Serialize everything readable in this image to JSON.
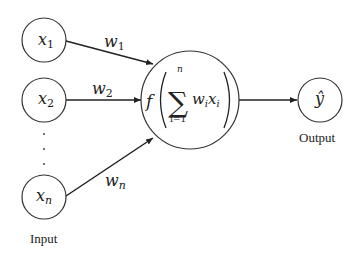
{
  "diagram": {
    "type": "perceptron",
    "inputs": [
      {
        "id": "x1",
        "var": "x",
        "sub": "1",
        "weight_var": "w",
        "weight_sub": "1"
      },
      {
        "id": "x2",
        "var": "x",
        "sub": "2",
        "weight_var": "w",
        "weight_sub": "2"
      },
      {
        "id": "xn",
        "var": "x",
        "sub": "n",
        "weight_var": "w",
        "weight_sub": "n"
      }
    ],
    "ellipsis": "⋮",
    "neuron": {
      "func": "f",
      "sum_symbol": "∑",
      "sum_upper": "n",
      "sum_lower": "i=1",
      "term_w": "w",
      "term_w_sub": "i",
      "term_x": "x",
      "term_x_sub": "i"
    },
    "output": {
      "symbol": "ŷ"
    },
    "labels": {
      "input": "Input",
      "output": "Output"
    }
  }
}
